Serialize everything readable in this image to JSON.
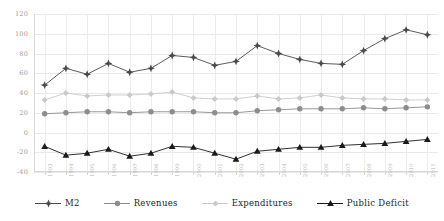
{
  "chart_data": {
    "type": "line",
    "title": "",
    "subtitle": "",
    "xlabel": "",
    "ylabel": "",
    "ylim": [
      -40,
      120
    ],
    "yticks": [
      -40,
      -20,
      0,
      20,
      40,
      60,
      80,
      100,
      120
    ],
    "grid": true,
    "legend_position": "bottom",
    "categories": [
      "1993",
      "1994",
      "1995",
      "1996",
      "1997",
      "1998",
      "1999",
      "2000",
      "2001",
      "2002",
      "2003",
      "2004",
      "2005",
      "2006",
      "2007",
      "2008",
      "2009",
      "2010",
      "2011"
    ],
    "series": [
      {
        "name": "M2",
        "color": "#4a4a4a",
        "marker": "diamond-plus",
        "values": [
          48,
          65,
          59,
          70,
          61,
          65,
          78,
          76,
          68,
          72,
          88,
          80,
          74,
          70,
          69,
          83,
          95,
          104,
          99
        ]
      },
      {
        "name": "Revenues",
        "color": "#8d8d8d",
        "marker": "circle",
        "values": [
          19,
          20,
          21,
          21,
          20,
          21,
          21,
          21,
          20,
          20,
          22,
          23,
          24,
          24,
          24,
          25,
          24,
          25,
          26
        ]
      },
      {
        "name": "Expenditures",
        "color": "#c9c9c9",
        "marker": "diamond",
        "values": [
          33,
          40,
          37,
          38,
          38,
          39,
          41,
          35,
          34,
          34,
          37,
          34,
          35,
          38,
          35,
          34,
          34,
          33,
          33
        ]
      },
      {
        "name": "Public Deficit",
        "color": "#1a1a1a",
        "marker": "triangle",
        "values": [
          -14,
          -23,
          -21,
          -17,
          -24,
          -21,
          -14,
          -15,
          -21,
          -27,
          -19,
          -17,
          -15,
          -15,
          -13,
          -12,
          -11,
          -9,
          -7
        ]
      }
    ]
  },
  "legend": {
    "items": [
      {
        "label": "M2"
      },
      {
        "label": "Revenues"
      },
      {
        "label": "Expenditures"
      },
      {
        "label": "Public Deficit"
      }
    ]
  }
}
